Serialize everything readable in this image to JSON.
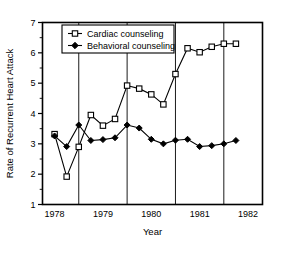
{
  "chart_data": {
    "type": "line",
    "title": "",
    "xlabel": "Year",
    "ylabel": "Rate of Recurrent Heart Attack",
    "xlim": [
      1977.75,
      1982.3
    ],
    "ylim": [
      1,
      7
    ],
    "grid": "vertical-only",
    "legend_position": "top-left-inside",
    "xticks": [
      1978,
      1979,
      1980,
      1981,
      1982
    ],
    "xticklabels": [
      "1978",
      "1979",
      "1980",
      "1981",
      "1982"
    ],
    "yticks": [
      1,
      2,
      3,
      4,
      5,
      6,
      7
    ],
    "yticklabels": [
      "1",
      "2",
      "3",
      "4",
      "5",
      "6",
      "7"
    ],
    "yminorticks": [
      1.5,
      2.5,
      3.5,
      4.5,
      5.5,
      6.5
    ],
    "gridline_x": [
      1978.5,
      1979.5,
      1980.5,
      1981.5
    ],
    "series": [
      {
        "name": "Cardiac counseling",
        "marker": "open-square",
        "color": "#000000",
        "x": [
          1978.0,
          1978.25,
          1978.5,
          1978.75,
          1979.0,
          1979.25,
          1979.5,
          1979.75,
          1980.0,
          1980.25,
          1980.5,
          1980.75,
          1981.0,
          1981.25,
          1981.5,
          1981.75
        ],
        "values": [
          3.32,
          1.92,
          2.9,
          3.95,
          3.6,
          3.82,
          4.92,
          4.82,
          4.63,
          4.3,
          5.3,
          6.15,
          6.02,
          6.2,
          6.3,
          6.3
        ]
      },
      {
        "name": "Behavioral counseling",
        "marker": "filled-diamond",
        "color": "#000000",
        "x": [
          1978.0,
          1978.25,
          1978.5,
          1978.75,
          1979.0,
          1979.25,
          1979.5,
          1979.75,
          1980.0,
          1980.25,
          1980.5,
          1980.75,
          1981.0,
          1981.25,
          1981.5,
          1981.75
        ],
        "values": [
          3.26,
          2.91,
          3.62,
          3.11,
          3.14,
          3.2,
          3.62,
          3.52,
          3.15,
          3.0,
          3.12,
          3.15,
          2.91,
          2.94,
          3.0,
          3.11
        ]
      }
    ]
  }
}
